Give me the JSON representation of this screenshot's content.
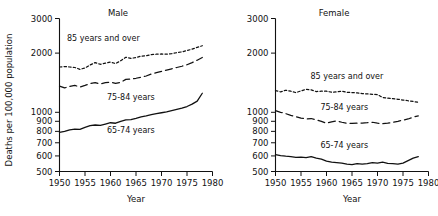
{
  "figure": {
    "ylabel": "Deaths  per  100,000  population",
    "xlabel_left": "Year",
    "xlabel_right": "Year"
  },
  "chart_data": [
    {
      "type": "line",
      "title": "Male",
      "xlabel": "Year",
      "ylabel": "Deaths per 100,000 population",
      "yscale": "log",
      "ylim": [
        500,
        3000
      ],
      "xlim": [
        1950,
        1980
      ],
      "yticks": [
        500,
        600,
        700,
        800,
        900,
        1000,
        2000,
        3000
      ],
      "ytick_labels": [
        "500",
        "600",
        "700",
        "800",
        "900",
        "1000",
        "2000",
        "3000"
      ],
      "xticks": [
        1950,
        1955,
        1960,
        1965,
        1970,
        1975,
        1980
      ],
      "xtick_labels": [
        "1950",
        "1955",
        "1960",
        "1965",
        "1970",
        "1975",
        "1980"
      ],
      "grid": false,
      "legend_position": "inline-annotations",
      "x": [
        1950,
        1951,
        1952,
        1953,
        1954,
        1955,
        1956,
        1957,
        1958,
        1959,
        1960,
        1961,
        1962,
        1963,
        1964,
        1965,
        1966,
        1967,
        1968,
        1969,
        1970,
        1971,
        1972,
        1973,
        1974,
        1975,
        1976,
        1977,
        1978
      ],
      "series": [
        {
          "name": "85 years and over",
          "style": "dotted",
          "label": "85  years  and  over",
          "values": [
            1700,
            1710,
            1700,
            1690,
            1655,
            1680,
            1740,
            1790,
            1755,
            1780,
            1800,
            1770,
            1830,
            1905,
            1880,
            1900,
            1930,
            1940,
            1965,
            1975,
            1980,
            1975,
            1990,
            2010,
            2030,
            2060,
            2095,
            2140,
            2180
          ]
        },
        {
          "name": "75-84 years",
          "style": "dashed",
          "label": "75-84  years",
          "values": [
            1360,
            1330,
            1355,
            1370,
            1345,
            1370,
            1400,
            1415,
            1395,
            1415,
            1425,
            1405,
            1420,
            1470,
            1475,
            1490,
            1510,
            1530,
            1565,
            1590,
            1615,
            1640,
            1665,
            1690,
            1715,
            1745,
            1790,
            1840,
            1900
          ]
        },
        {
          "name": "65-74 years",
          "style": "solid",
          "label": "65-74  years",
          "values": [
            790,
            800,
            815,
            822,
            818,
            838,
            855,
            862,
            858,
            872,
            885,
            880,
            900,
            915,
            918,
            932,
            948,
            958,
            972,
            985,
            995,
            1005,
            1020,
            1035,
            1050,
            1070,
            1100,
            1140,
            1250
          ]
        }
      ]
    },
    {
      "type": "line",
      "title": "Female",
      "xlabel": "Year",
      "ylabel": "Deaths per 100,000 population",
      "yscale": "log",
      "ylim": [
        500,
        3000
      ],
      "xlim": [
        1950,
        1980
      ],
      "yticks": [
        500,
        600,
        700,
        800,
        900,
        1000,
        2000,
        3000
      ],
      "ytick_labels": [
        "500",
        "600",
        "700",
        "800",
        "900",
        "1000",
        "2000",
        "3000"
      ],
      "xticks": [
        1950,
        1955,
        1960,
        1965,
        1970,
        1975,
        1980
      ],
      "xtick_labels": [
        "1950",
        "1955",
        "1960",
        "1965",
        "1970",
        "1975",
        "1980"
      ],
      "grid": false,
      "legend_position": "inline-annotations",
      "x": [
        1950,
        1951,
        1952,
        1953,
        1954,
        1955,
        1956,
        1957,
        1958,
        1959,
        1960,
        1961,
        1962,
        1963,
        1964,
        1965,
        1966,
        1967,
        1968,
        1969,
        1970,
        1971,
        1972,
        1973,
        1974,
        1975,
        1976,
        1977,
        1978
      ],
      "series": [
        {
          "name": "85 years and over",
          "style": "dotted",
          "label": "85  years  and  over",
          "values": [
            1290,
            1270,
            1295,
            1280,
            1260,
            1285,
            1310,
            1300,
            1275,
            1280,
            1280,
            1265,
            1270,
            1280,
            1265,
            1260,
            1255,
            1245,
            1240,
            1235,
            1230,
            1190,
            1180,
            1175,
            1165,
            1155,
            1145,
            1135,
            1125
          ]
        },
        {
          "name": "75-84 years",
          "style": "dashed",
          "label": "75-84  years",
          "values": [
            1020,
            1000,
            985,
            965,
            950,
            935,
            925,
            930,
            915,
            900,
            880,
            895,
            905,
            890,
            880,
            878,
            880,
            882,
            885,
            890,
            880,
            875,
            880,
            890,
            900,
            912,
            925,
            945,
            960
          ]
        },
        {
          "name": "65-74 years",
          "style": "solid",
          "label": "65-74  years",
          "values": [
            610,
            602,
            598,
            595,
            590,
            592,
            588,
            595,
            585,
            578,
            565,
            558,
            555,
            552,
            545,
            542,
            548,
            545,
            548,
            555,
            552,
            558,
            550,
            548,
            545,
            552,
            568,
            585,
            595
          ]
        }
      ]
    }
  ]
}
